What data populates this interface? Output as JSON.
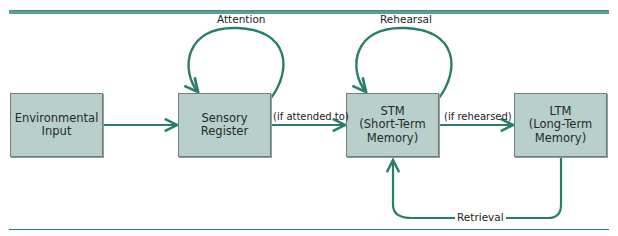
{
  "diagram": {
    "type": "flowchart",
    "title": "",
    "colors": {
      "arrow": "#2a7d6a",
      "box_fill": "#b9cfcb",
      "rule": "#5f9e90"
    },
    "nodes": [
      {
        "id": "env",
        "lines": [
          "Environmental",
          "Input"
        ]
      },
      {
        "id": "sensory",
        "lines": [
          "Sensory",
          "Register"
        ]
      },
      {
        "id": "stm",
        "lines": [
          "STM",
          "(Short-Term",
          "Memory)"
        ]
      },
      {
        "id": "ltm",
        "lines": [
          "LTM",
          "(Long-Term",
          "Memory)"
        ]
      }
    ],
    "edges": [
      {
        "from": "env",
        "to": "sensory",
        "label": ""
      },
      {
        "from": "sensory",
        "to": "sensory",
        "label": "Attention"
      },
      {
        "from": "sensory",
        "to": "stm",
        "label": "(if attended to)"
      },
      {
        "from": "stm",
        "to": "stm",
        "label": "Rehearsal"
      },
      {
        "from": "stm",
        "to": "ltm",
        "label": "(if rehearsed)"
      },
      {
        "from": "ltm",
        "to": "stm",
        "label": "Retrieval"
      }
    ]
  }
}
